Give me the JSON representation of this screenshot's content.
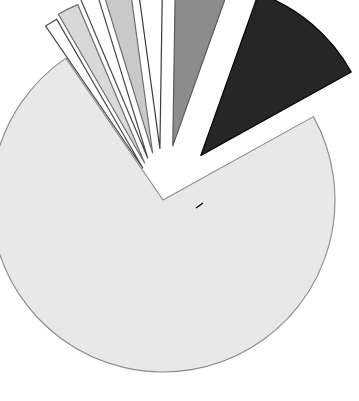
{
  "chart_data": {
    "type": "pie",
    "title": "",
    "subtitle": "",
    "xlabel": "",
    "ylabel": "",
    "grid": false,
    "legend_position": "none",
    "total": 100,
    "start_angle_deg": -29,
    "direction": "clockwise",
    "center": {
      "x": 163,
      "y": 200
    },
    "radius": 172,
    "categories": [
      "Slice 1",
      "Slice 2",
      "Slice 3",
      "Slice 4",
      "Slice 5",
      "Slice 6",
      "Slice 7",
      "Slice 8"
    ],
    "values": [
      73.5,
      1.2,
      2.0,
      1.6,
      2.6,
      2.4,
      5.2,
      11.5
    ],
    "colors": [
      "#e8e8e8",
      "#ffffff",
      "#d8d8d8",
      "#ffffff",
      "#c9c9c9",
      "#ffffff",
      "#8c8c8c",
      "#262626"
    ],
    "edge_colors": [
      "#8a8a8a",
      "#4a4a4a",
      "#6e6e6e",
      "#4a4a4a",
      "#6e6e6e",
      "#3c3c3c",
      "#5a5a5a",
      "#000000"
    ],
    "explode": [
      0.0,
      0.22,
      0.24,
      0.26,
      0.28,
      0.3,
      0.32,
      0.34
    ],
    "slices": [
      {
        "label": "Slice 1",
        "value": 73.5,
        "color": "#e8e8e8",
        "edge": "#8a8a8a",
        "exploded": false,
        "path": "M 163 200 L 310 88.5 A 172 172 0 1 1 202.2 368.9 Z"
      },
      {
        "label": "Slice 2",
        "value": 1.2,
        "color": "#ffffff",
        "edge": "#4a4a4a",
        "exploded": true,
        "path": "M 175.6 217.3 L 188.2 222.6 A 18 18 0 0 1 179.0 232.2 Z"
      },
      {
        "label": "Slice 3",
        "value": 2.0,
        "color": "#d8d8d8",
        "edge": "#6e6e6e",
        "exploded": true,
        "path": "M 196.5 212.1 L 231.5 337.0 A 130 130 0 0 1 216.1 340.2 Z"
      },
      {
        "label": "Slice 4",
        "value": 1.6,
        "color": "#ffffff",
        "edge": "#4a4a4a",
        "exploded": true,
        "path": "M 199.0 211.2 L 246.1 330.9 A 130 130 0 0 1 233.4 336.5 Z"
      },
      {
        "label": "Slice 5",
        "value": 2.6,
        "color": "#c9c9c9",
        "edge": "#6e6e6e",
        "exploded": true,
        "path": "M 202.0 210.0 L 263.0 322.5 A 130 130 0 0 1 246.3 331.6 Z"
      },
      {
        "label": "Slice 6",
        "value": 2.4,
        "color": "#ffffff",
        "edge": "#3c3c3c",
        "exploded": true,
        "path": "M 204.5 209.0 L 283.6 310.3 A 130 130 0 0 1 266.7 321.5 Z"
      },
      {
        "label": "Slice 7",
        "value": 5.2,
        "color": "#8c8c8c",
        "edge": "#5a5a5a",
        "exploded": true,
        "path": "M 207.6 208.0 L 310.4 290.6 A 140 140 0 0 1 283.8 313.4 Z"
      },
      {
        "label": "Slice 8",
        "value": 11.5,
        "color": "#262626",
        "edge": "#000000",
        "exploded": true,
        "path": "M 210.8 206.7 L 338.5 262.0 A 150 150 0 0 1 311.0 310.5 Z"
      }
    ],
    "annotations": [
      {
        "name": "pointer-line",
        "type": "line",
        "x1": 203,
        "y1": 203,
        "x2": 196,
        "y2": 208
      }
    ],
    "background_color": "#ffffff"
  },
  "figure": {
    "width": 359,
    "height": 401
  }
}
